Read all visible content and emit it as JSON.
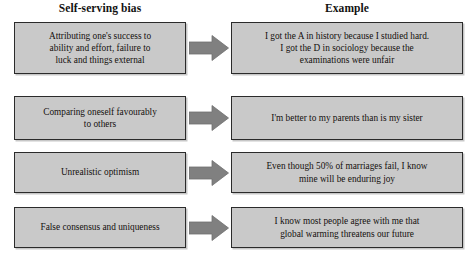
{
  "diagram": {
    "columns": {
      "left_header": "Self-serving bias",
      "right_header": "Example"
    },
    "colors": {
      "box_fill": "#c9c9c9",
      "box_border": "#2b2b2b",
      "arrow_fill": "#808080",
      "arrow_border": "#5a5a5a",
      "text": "#14100e",
      "background": "#ffffff"
    },
    "arrow_icon_name": "right-arrow-icon",
    "rows": [
      {
        "bias": "Attributing one's success to\nability and effort, failure to\nluck and things external",
        "example": "I got the A in history because I studied hard.\nI got the D in sociology because the\nexaminations were unfair"
      },
      {
        "bias": "Comparing oneself favourably\nto others",
        "example": "I'm better to my parents than is my sister"
      },
      {
        "bias": "Unrealistic optimism",
        "example": "Even though 50% of marriages fail, I know\nmine will be enduring joy"
      },
      {
        "bias": "False consensus and uniqueness",
        "example": "I know most people agree with me that\nglobal warming threatens our future"
      }
    ]
  }
}
